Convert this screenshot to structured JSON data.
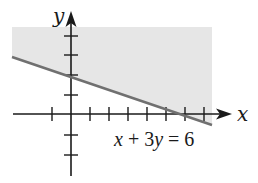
{
  "graph": {
    "x_axis_label": "x",
    "y_axis_label": "y",
    "equation_label": "x + 3y = 6",
    "equation_parts": {
      "x": "x",
      "plus": " + 3",
      "y": "y",
      "rest": " = 6"
    },
    "boundary_line": "x + 3y = 6",
    "shaded_region": "above the line (x + 3y ≥ 6 side)",
    "x_ticks": [
      -1,
      1,
      2,
      3,
      4,
      5,
      6,
      7
    ],
    "y_ticks": [
      4,
      3,
      2,
      1,
      -1,
      -2,
      -3
    ],
    "colors": {
      "shade": "#e6e6e6",
      "line": "#707070",
      "axes": "#1a1a1a"
    }
  }
}
